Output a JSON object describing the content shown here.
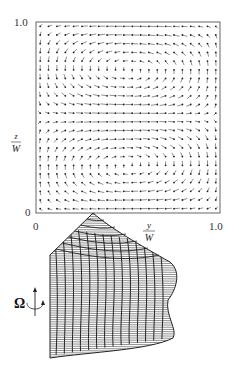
{
  "figure": {
    "top_panel": {
      "type": "vector-field",
      "description": "Secondary flow velocity vectors in square cross-section showing two counter-rotating cells",
      "x_axis": {
        "label_num": "y",
        "label_den": "W",
        "ticks": [
          "0",
          "1.0"
        ],
        "range": [
          0,
          1.0
        ]
      },
      "y_axis": {
        "label_num": "z",
        "label_den": "W",
        "ticks": [
          "0",
          "1.0"
        ],
        "range": [
          0,
          1.0
        ]
      },
      "cells": [
        {
          "name": "upper-vortex",
          "center": [
            0.5,
            0.72
          ],
          "rotation": "clockwise"
        },
        {
          "name": "lower-vortex",
          "center": [
            0.5,
            0.28
          ],
          "rotation": "counter-clockwise"
        }
      ],
      "grid_points": 22
    },
    "bottom_panel": {
      "type": "surface-mesh",
      "description": "3D wireframe surface of streamwise velocity profile",
      "rotation_symbol": "Ω",
      "rotation_icon": "rotation-axis-icon"
    }
  }
}
